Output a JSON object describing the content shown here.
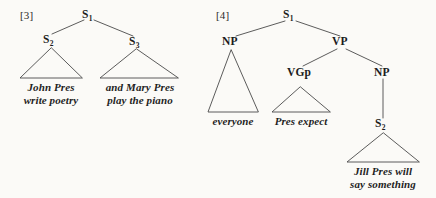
{
  "figure": {
    "background_color": "#fbfaf7",
    "line_color": "#4a4a4a",
    "text_color": "#1a1a1a"
  },
  "trees": [
    {
      "example_label": "[3]",
      "root": {
        "base": "S",
        "subscript": "1"
      },
      "nodes": [
        {
          "base": "S",
          "subscript": "2"
        },
        {
          "base": "S",
          "subscript": "3"
        }
      ],
      "terminals": [
        {
          "line1": "John Pres",
          "line2": "write poetry"
        },
        {
          "line1": "and Mary Pres",
          "line2": "play the piano"
        }
      ]
    },
    {
      "example_label": "[4]",
      "root": {
        "base": "S",
        "subscript": "1"
      },
      "nodes": [
        {
          "base": "NP",
          "subscript": ""
        },
        {
          "base": "VP",
          "subscript": ""
        },
        {
          "base": "VGp",
          "subscript": ""
        },
        {
          "base": "NP",
          "subscript": ""
        },
        {
          "base": "S",
          "subscript": "2"
        }
      ],
      "terminals": [
        {
          "line1": "everyone",
          "line2": ""
        },
        {
          "line1": "Pres expect",
          "line2": ""
        },
        {
          "line1": "Jill Pres will",
          "line2": "say something"
        }
      ]
    }
  ],
  "labels": {
    "ex3": "[3]",
    "ex4": "[4]",
    "s1_left_base": "S",
    "s1_left_sub": "1",
    "s2_left_base": "S",
    "s2_left_sub": "2",
    "s3_left_base": "S",
    "s3_left_sub": "3",
    "t_john": "John Pres",
    "t_john2": "write poetry",
    "t_mary": "and Mary Pres",
    "t_mary2": "play the piano",
    "s1_right_base": "S",
    "s1_right_sub": "1",
    "np_subj": "NP",
    "vp": "VP",
    "vgp": "VGp",
    "np_obj": "NP",
    "s2_right_base": "S",
    "s2_right_sub": "2",
    "t_everyone": "everyone",
    "t_presexpect": "Pres expect",
    "t_jill": "Jill Pres will",
    "t_jill2": "say something"
  }
}
